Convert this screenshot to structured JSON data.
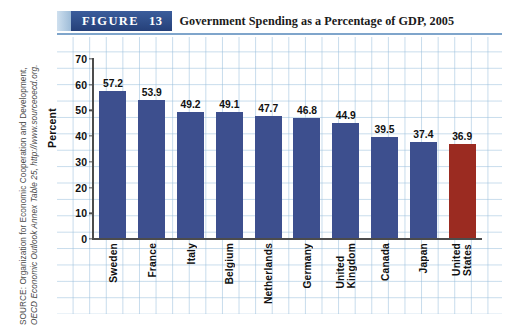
{
  "figure": {
    "badge_label": "FIGURE",
    "badge_number": "13",
    "title": "Government Spending as a Percentage of GDP, 2005"
  },
  "source": {
    "line1": "SOURCE: Organization for Economic Cooperation and Development,",
    "line2": "OECD Economic Outlook Annex Table 25, http://www.sourceoecd.org."
  },
  "colors": {
    "bar": "#3d4f8e",
    "bar_highlight": "#9b2b21",
    "badge": "#2b4a86",
    "grid": "#98bedc",
    "rule": "#7fa5cb"
  },
  "chart_data": {
    "type": "bar",
    "title": "Government Spending as a Percentage of GDP, 2005",
    "xlabel": "",
    "ylabel": "Percent",
    "ylim": [
      0,
      70
    ],
    "yticks": [
      0,
      10,
      20,
      30,
      40,
      50,
      60,
      70
    ],
    "ytick_labels": [
      "0",
      "10",
      "20",
      "30",
      "40",
      "50",
      "60",
      "70"
    ],
    "grid": true,
    "legend": "none",
    "categories": [
      "Sweden",
      "France",
      "Italy",
      "Belgium",
      "Netherlands",
      "Germany",
      "United Kingdom",
      "Canada",
      "Japan",
      "United States"
    ],
    "category_lines": [
      [
        "Sweden"
      ],
      [
        "France"
      ],
      [
        "Italy"
      ],
      [
        "Belgium"
      ],
      [
        "Netherlands"
      ],
      [
        "Germany"
      ],
      [
        "United",
        "Kingdom"
      ],
      [
        "Canada"
      ],
      [
        "Japan"
      ],
      [
        "United",
        "States"
      ]
    ],
    "values": [
      57.2,
      53.9,
      49.2,
      49.1,
      47.7,
      46.8,
      44.9,
      39.5,
      37.4,
      36.9
    ],
    "value_labels": [
      "57.2",
      "53.9",
      "49.2",
      "49.1",
      "47.7",
      "46.8",
      "44.9",
      "39.5",
      "37.4",
      "36.9"
    ],
    "highlight_index": 9
  }
}
